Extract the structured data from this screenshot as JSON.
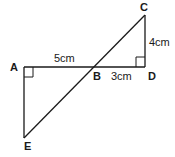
{
  "diagram": {
    "points": {
      "A": "A",
      "B": "B",
      "C": "C",
      "D": "D",
      "E": "E"
    },
    "measurements": {
      "AB": "5cm",
      "BD": "3cm",
      "CD": "4cm"
    },
    "right_angles": [
      "A",
      "D"
    ],
    "colors": {
      "line": "#1a1a1a",
      "background": "#ffffff"
    }
  }
}
